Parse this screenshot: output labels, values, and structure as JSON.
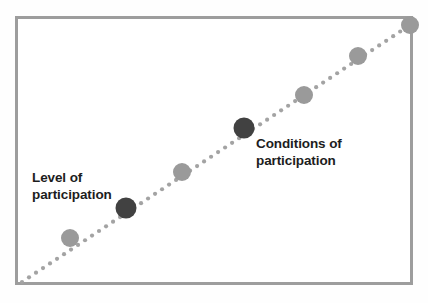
{
  "figure": {
    "type": "diagram",
    "background_color": "#fefefe",
    "frame": {
      "border_color": "#9d9d9d",
      "border_width_px": 3,
      "fill_color": "#ffffff",
      "x": 15,
      "y": 16,
      "width": 398,
      "height": 269
    }
  },
  "chart_data": {
    "type": "scatter",
    "title": "",
    "subtitle": "",
    "xlabel": "",
    "ylabel": "",
    "grid": false,
    "legend_position": "none",
    "trend_line": {
      "style": "dotted",
      "color": "#a3a3a3",
      "dot_radius_px": 2.1,
      "dot_spacing_px": 8.4,
      "from": {
        "x": 22,
        "y": 282
      },
      "to": {
        "x": 410,
        "y": 25
      }
    },
    "series": [
      {
        "name": "Progression of participation",
        "marker": "circle",
        "points": [
          {
            "x": 70,
            "y": 238,
            "emphasis": "low",
            "color": "#9a9a9a",
            "radius": 9,
            "label": ""
          },
          {
            "x": 126,
            "y": 208,
            "emphasis": "high",
            "color": "#414141",
            "radius": 10.5,
            "label": "Level of participation"
          },
          {
            "x": 182,
            "y": 172,
            "emphasis": "low",
            "color": "#9a9a9a",
            "radius": 9,
            "label": ""
          },
          {
            "x": 244,
            "y": 128,
            "emphasis": "high",
            "color": "#414141",
            "radius": 10.5,
            "label": "Conditions of participation"
          },
          {
            "x": 304,
            "y": 95,
            "emphasis": "low",
            "color": "#9a9a9a",
            "radius": 9,
            "label": ""
          },
          {
            "x": 358,
            "y": 56,
            "emphasis": "low",
            "color": "#9a9a9a",
            "radius": 9,
            "label": ""
          },
          {
            "x": 410,
            "y": 25,
            "emphasis": "low",
            "color": "#9a9a9a",
            "radius": 9,
            "label": ""
          }
        ]
      }
    ],
    "annotations": [
      {
        "name": "level-of-participation",
        "text": "Level of\nparticipation",
        "anchor_point": {
          "x": 126,
          "y": 208
        },
        "text_position": {
          "x": 32,
          "y": 170
        },
        "bold": true,
        "color": "#1d1d1d"
      },
      {
        "name": "conditions-of-participation",
        "text": "Conditions of\nparticipation",
        "anchor_point": {
          "x": 244,
          "y": 128
        },
        "text_position": {
          "x": 256,
          "y": 136
        },
        "bold": true,
        "color": "#1d1d1d"
      }
    ]
  },
  "labels": {
    "level": "Level of\nparticipation",
    "conditions": "Conditions of\nparticipation"
  }
}
